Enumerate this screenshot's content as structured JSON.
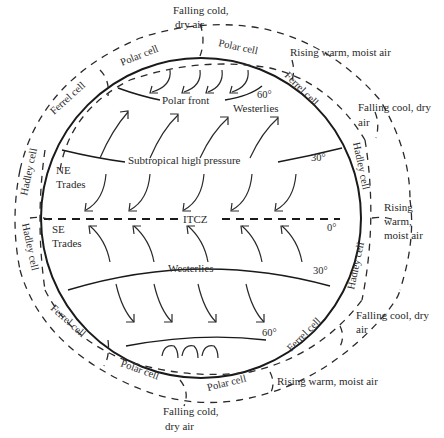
{
  "diagram": {
    "labels": {
      "top_falling": [
        "Falling cold,",
        "dry air"
      ],
      "top_right_rising": "Rising warm, moist air",
      "right_falling_upper": [
        "Falling cool, dry",
        "air"
      ],
      "right_rising": [
        "Rising",
        "warm,",
        "moist air"
      ],
      "right_falling_lower": [
        "Falling cool, dry",
        "air"
      ],
      "bottom_right_rising": "Rising warm, moist air",
      "bottom_falling": [
        "Falling cold,",
        "dry air"
      ]
    },
    "interior": {
      "polar_front": "Polar front",
      "westerlies_north": "Westerlies",
      "subtropical_high": "Subtropical high pressure",
      "ne_trades": [
        "NE",
        "Trades"
      ],
      "itcz": "ITCZ",
      "se_trades": [
        "SE",
        "Trades"
      ],
      "westerlies_south": "Westerlies"
    },
    "latitudes": {
      "north_60": "60°",
      "north_30": "30°",
      "equator": "0°",
      "south_30": "30°",
      "south_60": "60°"
    },
    "cells": {
      "polar_cell_nw": "Polar cell",
      "polar_cell_ne": "Polar cell",
      "ferrel_cell_nw": "Ferrel cell",
      "ferrel_cell_ne": "Ferrel cell",
      "hadley_cell_nw": "Hadley cell",
      "hadley_cell_ne": "Hadley cell",
      "hadley_cell_sw": "Hadley cell",
      "hadley_cell_se": "Hadley cell",
      "ferrel_cell_sw": "Ferrel cell",
      "ferrel_cell_se": "Ferrel cell",
      "polar_cell_sw": "Polar cell",
      "polar_cell_se": "Polar cell"
    }
  }
}
